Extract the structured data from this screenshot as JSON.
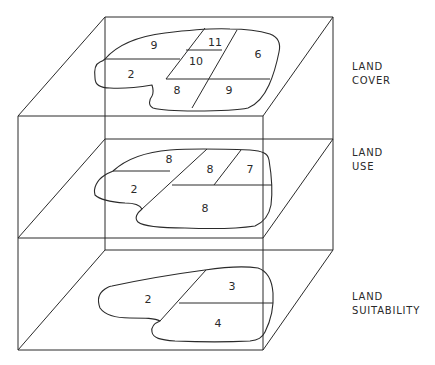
{
  "diagram": {
    "colors": {
      "line": "#2a2a2a",
      "background": "#ffffff"
    },
    "layers": [
      {
        "id": "land-cover",
        "label_line1": "LAND",
        "label_line2": "COVER",
        "parcels": [
          {
            "value": "9",
            "x": 154,
            "y": 49
          },
          {
            "value": "11",
            "x": 215,
            "y": 46
          },
          {
            "value": "10",
            "x": 196,
            "y": 64
          },
          {
            "value": "6",
            "x": 258,
            "y": 58
          },
          {
            "value": "2",
            "x": 131,
            "y": 78
          },
          {
            "value": "8",
            "x": 177,
            "y": 94
          },
          {
            "value": "9",
            "x": 229,
            "y": 94
          }
        ]
      },
      {
        "id": "land-use",
        "label_line1": "LAND",
        "label_line2": "USE",
        "parcels": [
          {
            "value": "8",
            "x": 169,
            "y": 163
          },
          {
            "value": "8",
            "x": 210,
            "y": 172
          },
          {
            "value": "7",
            "x": 250,
            "y": 172
          },
          {
            "value": "2",
            "x": 134,
            "y": 192
          },
          {
            "value": "8",
            "x": 205,
            "y": 211
          }
        ]
      },
      {
        "id": "land-suitability",
        "label_line1": "LAND",
        "label_line2": "SUITABILITY",
        "parcels": [
          {
            "value": "3",
            "x": 232,
            "y": 290
          },
          {
            "value": "2",
            "x": 148,
            "y": 302
          },
          {
            "value": "4",
            "x": 218,
            "y": 326
          }
        ]
      }
    ]
  }
}
